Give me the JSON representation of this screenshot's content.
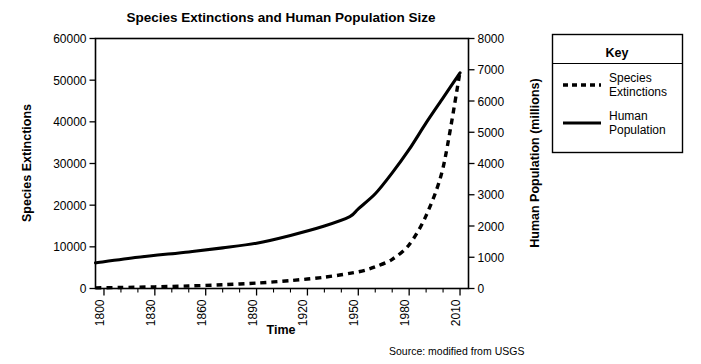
{
  "chart_data": {
    "type": "line",
    "title": "Species Extinctions and Human Population Size",
    "xlabel": "Time",
    "ylabel": "Species Extinctions",
    "y2label": "Human Population (millions)",
    "xlim": [
      1795,
      2015
    ],
    "ylim": [
      0,
      60000
    ],
    "y2lim": [
      0,
      8000
    ],
    "xticks": [
      1800,
      1830,
      1860,
      1890,
      1920,
      1950,
      1980,
      2010
    ],
    "xticklabels": [
      "1800",
      "1830",
      "1860",
      "1890",
      "1920",
      "1950",
      "1980",
      "2010"
    ],
    "xminor_step": 10,
    "yticks": [
      0,
      10000,
      20000,
      30000,
      40000,
      50000,
      60000
    ],
    "yticklabels": [
      "0",
      "10000",
      "20000",
      "30000",
      "40000",
      "50000",
      "60000"
    ],
    "y2ticks": [
      0,
      1000,
      2000,
      3000,
      4000,
      5000,
      6000,
      7000,
      8000
    ],
    "y2ticklabels": [
      "0",
      "1000",
      "2000",
      "3000",
      "4000",
      "5000",
      "6000",
      "7000",
      "8000"
    ],
    "grid": false,
    "legend_position": "outside-right-top",
    "caption": "Source: modified from USGS",
    "series": [
      {
        "name": "Species Extinctions",
        "axis": "left",
        "style": "dashed",
        "color": "#000000",
        "x": [
          1795,
          1810,
          1830,
          1850,
          1870,
          1890,
          1910,
          1930,
          1950,
          1960,
          1970,
          1980,
          1990,
          2000,
          2010
        ],
        "values": [
          150,
          250,
          400,
          600,
          900,
          1300,
          1900,
          2700,
          4000,
          5200,
          7000,
          10500,
          17500,
          29000,
          52000
        ]
      },
      {
        "name": "Human Population",
        "axis": "right",
        "style": "solid",
        "color": "#000000",
        "x": [
          1795,
          1820,
          1850,
          1870,
          1890,
          1910,
          1930,
          1945,
          1950,
          1960,
          1970,
          1980,
          1990,
          2000,
          2010
        ],
        "values": [
          820,
          1000,
          1170,
          1300,
          1450,
          1700,
          2000,
          2300,
          2550,
          3030,
          3700,
          4450,
          5300,
          6100,
          6900
        ]
      }
    ]
  },
  "legend": {
    "title": "Key",
    "items": [
      {
        "label_line1": "Species",
        "label_line2": "Extinctions",
        "style": "dashed"
      },
      {
        "label_line1": "Human",
        "label_line2": "Population",
        "style": "solid"
      }
    ]
  },
  "colors": {
    "ink": "#000000",
    "background": "#ffffff"
  }
}
